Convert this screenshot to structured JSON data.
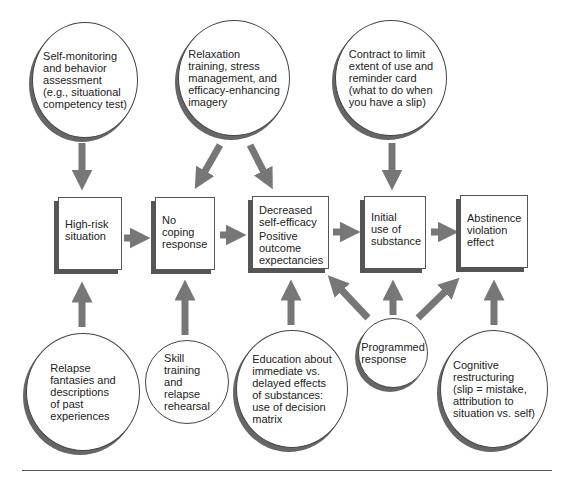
{
  "colors": {
    "arrow": "#777777",
    "border": "#444444",
    "shadow": "#666666"
  },
  "circles": {
    "self_monitoring": "Self-monitoring\nand behavior\nassessment\n(e.g., situational\ncompetency test)",
    "relaxation": "Relaxation\ntraining, stress\nmanagement, and\nefficacy-enhancing\nimagery",
    "contract": "Contract to limit\nextent of use and\nreminder card\n(what to do when\nyou have a slip)",
    "relapse_fantasies": "Relapse\nfantasies and\ndescriptions\nof past\nexperiences",
    "skill_training": "Skill\ntraining\nand\nrelapse\nrehearsal",
    "education": "Education about\nimmediate vs.\ndelayed effects\nof substances:\nuse of decision\nmatrix",
    "programmed": "Programmed\nresponse",
    "cognitive": "Cognitive\nrestructuring\n(slip = mistake,\nattribution to\nsituation vs. self)"
  },
  "boxes": {
    "high_risk": "High-risk\nsituation",
    "no_coping": "No\ncoping\nresponse",
    "decreased_1": "Decreased\nself-efficacy",
    "decreased_2": "Positive\noutcome\nexpectancies",
    "initial_use": "Initial\nuse of\nsubstance",
    "abstinence": "Abstinence\nviolation\neffect"
  }
}
